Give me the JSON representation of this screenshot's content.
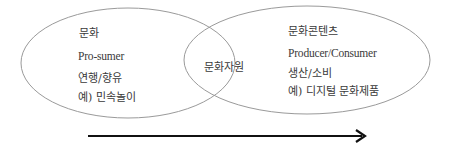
{
  "left": {
    "title": "문화",
    "role": "Pro-sumer",
    "activity": "연행/향유",
    "example": "예) 민속놀이"
  },
  "center": {
    "label": "문화자원"
  },
  "right": {
    "title": "문화콘텐츠",
    "role": "Producer/Consumer",
    "activity": "생산/소비",
    "example": "예) 디지털 문화제품"
  },
  "arrow": {
    "direction": "right"
  }
}
